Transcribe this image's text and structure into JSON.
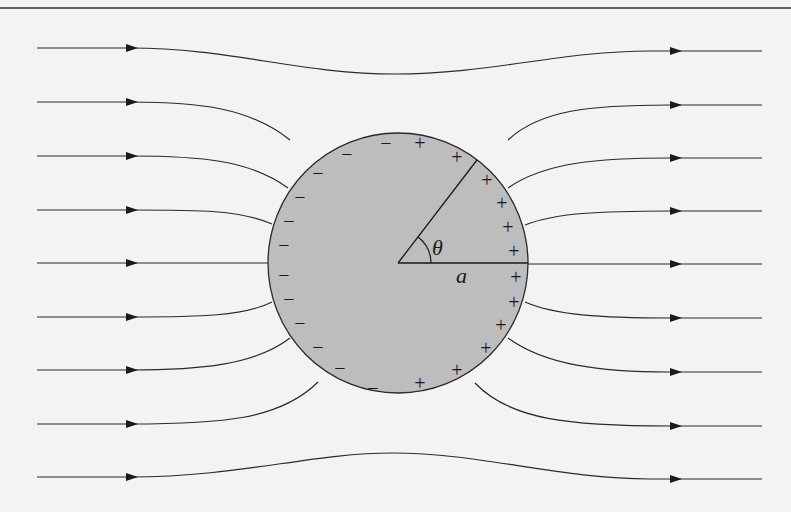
{
  "figure": {
    "labels": {
      "angle": "θ",
      "radius": "a"
    },
    "colors": {
      "background": "#f3f3f3",
      "sphere_fill": "#bdbdbd",
      "line": "#2a2a2a"
    },
    "sphere": {
      "cx": 398,
      "cy": 263,
      "r": 130
    },
    "field_lines_y": [
      48,
      102,
      156,
      210,
      263,
      317,
      371,
      425,
      478
    ],
    "charges": {
      "negative_symbol": "−",
      "positive_symbol": "+",
      "negative": [
        [
          386,
          143
        ],
        [
          347,
          154
        ],
        [
          318,
          173
        ],
        [
          300,
          197
        ],
        [
          289,
          221
        ],
        [
          284,
          245
        ],
        [
          284,
          275
        ],
        [
          289,
          299
        ],
        [
          300,
          323
        ],
        [
          318,
          347
        ],
        [
          340,
          368
        ],
        [
          373,
          388
        ]
      ],
      "positive": [
        [
          420,
          143
        ],
        [
          457,
          157
        ],
        [
          487,
          180
        ],
        [
          502,
          203
        ],
        [
          508,
          227
        ],
        [
          514,
          251
        ],
        [
          516,
          277
        ],
        [
          514,
          302
        ],
        [
          501,
          325
        ],
        [
          486,
          348
        ],
        [
          457,
          370
        ],
        [
          420,
          383
        ]
      ]
    }
  }
}
